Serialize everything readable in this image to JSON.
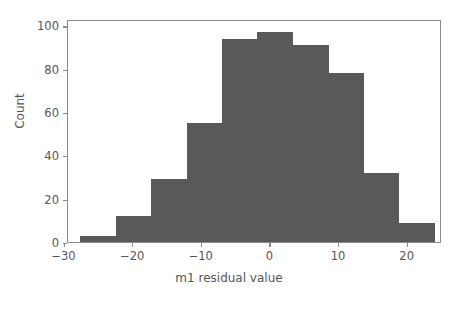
{
  "chart_data": {
    "type": "bar",
    "chart_subtype": "histogram",
    "title": "",
    "xlabel": "m1 residual value",
    "ylabel": "Count",
    "xlim": [
      -29.5,
      25.0
    ],
    "ylim": [
      0,
      103
    ],
    "xticks": [
      -30,
      -20,
      -10,
      0,
      10,
      20
    ],
    "xticklabels": [
      "−30",
      "−20",
      "−10",
      "0",
      "10",
      "20"
    ],
    "yticks": [
      0,
      20,
      40,
      60,
      80,
      100
    ],
    "yticklabels": [
      "0",
      "20",
      "40",
      "60",
      "80",
      "100"
    ],
    "grid": false,
    "legend": false,
    "bin_edges": [
      -27.7,
      -22.5,
      -17.4,
      -12.2,
      -7.0,
      -1.9,
      3.3,
      8.5,
      13.6,
      18.8,
      24.0
    ],
    "bin_centers": [
      -25.1,
      -20.0,
      -14.8,
      -9.6,
      -4.5,
      0.7,
      5.9,
      11.1,
      16.2,
      21.4
    ],
    "values": [
      3,
      12,
      29,
      55,
      94,
      97,
      91,
      78,
      32,
      9
    ],
    "bar_color": "#595959",
    "axes_edge_color": "#8a8a8a",
    "text_color": "#555555",
    "background_color": "#ffffff",
    "total_count": 500
  },
  "figure": {
    "background_color": "#ffffff"
  }
}
